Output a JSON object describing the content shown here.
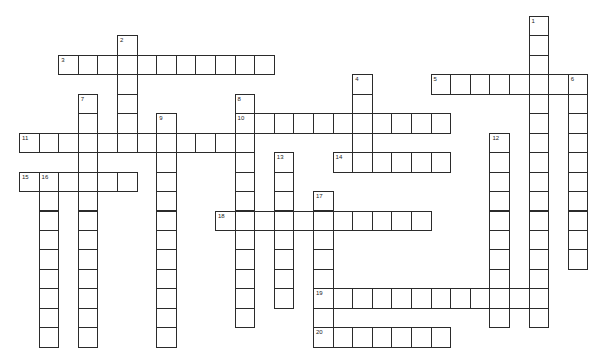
{
  "puzzle": {
    "cell_size": 19.6,
    "row_step": 19.45,
    "origin_x": 19,
    "origin_y": 16,
    "border_color": "#2b2b2b",
    "words": [
      {
        "number": "1",
        "direction": "down",
        "row": 0,
        "col": 26,
        "length": 16
      },
      {
        "number": "2",
        "direction": "down",
        "row": 1,
        "col": 5,
        "length": 6
      },
      {
        "number": "3",
        "direction": "across",
        "row": 2,
        "col": 2,
        "length": 11
      },
      {
        "number": "4",
        "direction": "down",
        "row": 3,
        "col": 17,
        "length": 5
      },
      {
        "number": "5",
        "direction": "across",
        "row": 3,
        "col": 21,
        "length": 8
      },
      {
        "number": "6",
        "direction": "down",
        "row": 3,
        "col": 28,
        "length": 10
      },
      {
        "number": "7",
        "direction": "down",
        "row": 4,
        "col": 3,
        "length": 13
      },
      {
        "number": "8",
        "direction": "down",
        "row": 4,
        "col": 11,
        "length": 12
      },
      {
        "number": "9",
        "direction": "down",
        "row": 5,
        "col": 7,
        "length": 12
      },
      {
        "number": "10",
        "direction": "across",
        "row": 5,
        "col": 11,
        "length": 11
      },
      {
        "number": "11",
        "direction": "across",
        "row": 6,
        "col": 0,
        "length": 12
      },
      {
        "number": "12",
        "direction": "down",
        "row": 6,
        "col": 24,
        "length": 10
      },
      {
        "number": "13",
        "direction": "down",
        "row": 7,
        "col": 13,
        "length": 8
      },
      {
        "number": "14",
        "direction": "across",
        "row": 7,
        "col": 16,
        "length": 6
      },
      {
        "number": "15",
        "direction": "across",
        "row": 8,
        "col": 0,
        "length": 6
      },
      {
        "number": "16",
        "direction": "down",
        "row": 8,
        "col": 1,
        "length": 9
      },
      {
        "number": "17",
        "direction": "down",
        "row": 9,
        "col": 15,
        "length": 8
      },
      {
        "number": "18",
        "direction": "across",
        "row": 10,
        "col": 10,
        "length": 11
      },
      {
        "number": "19",
        "direction": "across",
        "row": 14,
        "col": 15,
        "length": 12
      },
      {
        "number": "20",
        "direction": "across",
        "row": 16,
        "col": 15,
        "length": 7
      }
    ]
  }
}
